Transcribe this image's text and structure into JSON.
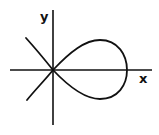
{
  "diagram": {
    "title": "",
    "axes": {
      "x_label": "x",
      "y_label": "y"
    },
    "curve": {
      "description": "Loop curve through origin with self-intersection at origin, loop to the right, two branches extending to the left",
      "type": "strophoid-like loop"
    },
    "colors": {
      "stroke": "#111111",
      "background": "#ffffff"
    }
  }
}
